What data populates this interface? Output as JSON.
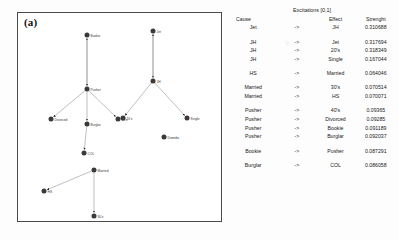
{
  "figure": {
    "panel_label": "(a)"
  },
  "graph": {
    "nodes": [
      {
        "id": "bookie",
        "label": "Bookie",
        "x": 86,
        "y": 34
      },
      {
        "id": "pusher",
        "label": "Pusher",
        "x": 86,
        "y": 88
      },
      {
        "id": "divorced",
        "label": "Divorced",
        "x": 50,
        "y": 118
      },
      {
        "id": "burglar",
        "label": "Burglar",
        "x": 86,
        "y": 123
      },
      {
        "id": "forties",
        "label": "40's",
        "x": 117,
        "y": 118
      },
      {
        "id": "col",
        "label": "COL",
        "x": 83,
        "y": 152
      },
      {
        "id": "married",
        "label": "Married",
        "x": 93,
        "y": 169
      },
      {
        "id": "hs",
        "label": "HS",
        "x": 43,
        "y": 190
      },
      {
        "id": "thirties",
        "label": "30's",
        "x": 93,
        "y": 215
      },
      {
        "id": "jet",
        "label": "Jet",
        "x": 152,
        "y": 30
      },
      {
        "id": "jh",
        "label": "JH",
        "x": 152,
        "y": 80
      },
      {
        "id": "twenties",
        "label": "20's",
        "x": 122,
        "y": 117
      },
      {
        "id": "single",
        "label": "Single",
        "x": 186,
        "y": 117
      },
      {
        "id": "dweebs",
        "label": "Dweebs",
        "x": 163,
        "y": 136
      }
    ],
    "edges": [
      {
        "from": "pusher",
        "to": "bookie"
      },
      {
        "from": "bookie",
        "to": "pusher"
      },
      {
        "from": "pusher",
        "to": "divorced"
      },
      {
        "from": "pusher",
        "to": "burglar"
      },
      {
        "from": "pusher",
        "to": "forties"
      },
      {
        "from": "burglar",
        "to": "col"
      },
      {
        "from": "married",
        "to": "hs"
      },
      {
        "from": "married",
        "to": "thirties"
      },
      {
        "from": "jet",
        "to": "jh"
      },
      {
        "from": "jh",
        "to": "jet"
      },
      {
        "from": "jh",
        "to": "twenties"
      },
      {
        "from": "jh",
        "to": "single"
      }
    ]
  },
  "table": {
    "title": "Excitations [0,1]",
    "headers": {
      "cause": "Cause",
      "arrow": "",
      "effect": "Effect",
      "strength": "Strenght"
    },
    "arrow_symbol": "->",
    "groups": [
      {
        "rows": [
          {
            "cause": "Jet",
            "arrow": "->",
            "effect": "JH",
            "strength": "0.310688"
          }
        ]
      },
      {
        "rows": [
          {
            "cause": "JH",
            "arrow": "->",
            "effect": "Jet",
            "strength": "0.317694"
          },
          {
            "cause": "JH",
            "arrow": "->",
            "effect": "20's",
            "strength": "0.318349"
          },
          {
            "cause": "JH",
            "arrow": "->",
            "effect": "Single",
            "strength": "0.167044"
          }
        ]
      },
      {
        "rows": [
          {
            "cause": "HS",
            "arrow": "->",
            "effect": "Married",
            "strength": "0.064046"
          }
        ]
      },
      {
        "rows": [
          {
            "cause": "Married",
            "arrow": "->",
            "effect": "30's",
            "strength": "0.070514"
          },
          {
            "cause": "Married",
            "arrow": "->",
            "effect": "HS",
            "strength": "0.070071"
          }
        ]
      },
      {
        "rows": [
          {
            "cause": "Pusher",
            "arrow": "->",
            "effect": "40's",
            "strength": "0.09365"
          },
          {
            "cause": "Pusher",
            "arrow": "->",
            "effect": "Divorced",
            "strength": "0.09285"
          },
          {
            "cause": "Pusher",
            "arrow": "->",
            "effect": "Bookie",
            "strength": "0.091189"
          },
          {
            "cause": "Pusher",
            "arrow": "->",
            "effect": "Burglar",
            "strength": "0.092037"
          }
        ]
      },
      {
        "rows": [
          {
            "cause": "Bookie",
            "arrow": "->",
            "effect": "Pusher",
            "strength": "0.087291"
          }
        ]
      },
      {
        "rows": [
          {
            "cause": "Burglar",
            "arrow": "->",
            "effect": "COL",
            "strength": "0.086058"
          }
        ]
      }
    ]
  },
  "colors": {
    "node": "#3a3a3a",
    "edge": "#8a8a8a",
    "arrowhead": "#1c1c1c",
    "panel_border": "#4a4a4a",
    "rule": "#c9c9c9"
  }
}
